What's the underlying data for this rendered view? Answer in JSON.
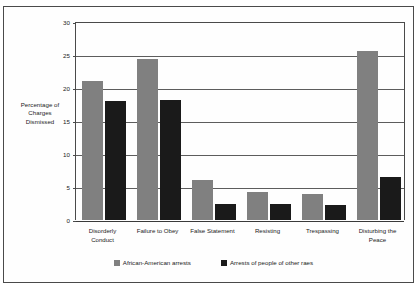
{
  "chart_data": {
    "type": "bar",
    "title": "",
    "xlabel": "",
    "ylabel": "Percentage of Charges Dismissed",
    "ylabel_lines": [
      "Percentage of",
      "Charges",
      "Dismissed"
    ],
    "ylim": [
      0,
      30
    ],
    "yticks": [
      0,
      5,
      10,
      15,
      20,
      25,
      30
    ],
    "ytick_labels": [
      "0",
      "5",
      "10",
      "15",
      "20",
      "25",
      "30"
    ],
    "grid": true,
    "legend_position": "bottom",
    "categories": [
      "Disorderly Conduct",
      "Failure to Obey",
      "False Statement",
      "Resisting",
      "Trespassing",
      "Disturbing the Peace"
    ],
    "category_lines": [
      [
        "Disorderly",
        "Conduct"
      ],
      [
        "Failure to Obey"
      ],
      [
        "False Statement"
      ],
      [
        "Resisting"
      ],
      [
        "Trespassing"
      ],
      [
        "Disturbing the",
        "Peace"
      ]
    ],
    "series": [
      {
        "name": "African-American arrests",
        "color": "#808080",
        "values": [
          21.1,
          24.4,
          6.0,
          4.2,
          3.9,
          25.6
        ]
      },
      {
        "name": "Arrests of people of other raes",
        "color": "#1a1a1a",
        "values": [
          18.0,
          18.2,
          2.5,
          2.4,
          2.3,
          6.5
        ]
      }
    ]
  }
}
